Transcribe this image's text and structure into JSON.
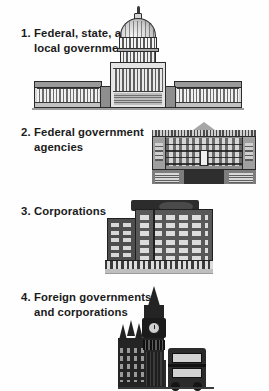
{
  "figure": {
    "background_color": "#ffffff",
    "text_color": "#1b1b1b"
  },
  "list": {
    "items": [
      {
        "number": "1.",
        "text": "Federal, state, and\nlocal governments",
        "illustration": "us-capitol-building",
        "illustration_alt": "United States Capitol building with central dome and two colonnaded wings"
      },
      {
        "number": "2.",
        "text": "Federal government\nagencies",
        "illustration": "neoclassical-government-agency-building",
        "illustration_alt": "Neoclassical government agency building with triangular pediment and row of columns"
      },
      {
        "number": "3.",
        "text": "Corporations",
        "illustration": "corporate-office-building",
        "illustration_alt": "Multi-story modern corporate office block with grid of windows"
      },
      {
        "number": "4.",
        "text": "Foreign governments\nand corporations",
        "illustration": "big-ben-westminster-and-double-decker-bus",
        "illustration_alt": "Big Ben clock tower with Westminster Palace and a London double-decker bus"
      }
    ]
  }
}
